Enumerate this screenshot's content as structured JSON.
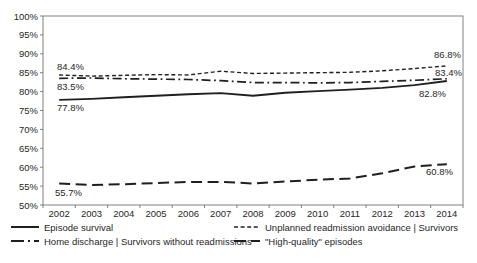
{
  "chart_data": {
    "type": "line",
    "title": "",
    "xlabel": "",
    "ylabel": "",
    "grid": false,
    "legend_position": "bottom two-column",
    "line_color": "#1f1f1f",
    "x": [
      "2002",
      "2003",
      "2004",
      "2005",
      "2006",
      "2007",
      "2008",
      "2009",
      "2010",
      "2011",
      "2012",
      "2013",
      "2014"
    ],
    "ylim": [
      50,
      100
    ],
    "yticks": [
      {
        "value": 100,
        "label": "100%"
      },
      {
        "value": 95,
        "label": "95%"
      },
      {
        "value": 90,
        "label": "90%"
      },
      {
        "value": 85,
        "label": "85%"
      },
      {
        "value": 80,
        "label": "80%"
      },
      {
        "value": 75,
        "label": "75%"
      },
      {
        "value": 70,
        "label": "70%"
      },
      {
        "value": 65,
        "label": "65%"
      },
      {
        "value": 60,
        "label": "60%"
      },
      {
        "value": 55,
        "label": "55%"
      },
      {
        "value": 50,
        "label": "50%"
      }
    ],
    "series": [
      {
        "name": "Episode survival",
        "dash": "solid",
        "values": [
          77.8,
          78.1,
          78.5,
          78.9,
          79.3,
          79.6,
          78.9,
          79.7,
          80.1,
          80.5,
          81.0,
          81.7,
          82.8
        ],
        "first_label": "77.8%",
        "last_label": "82.8%"
      },
      {
        "name": "Unplanned readmission avoidance | Survivors",
        "dash": "dash",
        "values": [
          84.4,
          84.1,
          84.3,
          84.5,
          84.4,
          85.4,
          84.8,
          84.9,
          85.0,
          85.1,
          85.5,
          86.1,
          86.8
        ],
        "first_label": "84.4%",
        "last_label": "86.8%"
      },
      {
        "name": "Home discharge | Survivors without readmissions",
        "dash": "dashdot",
        "values": [
          83.5,
          83.6,
          83.4,
          83.3,
          83.2,
          82.9,
          82.4,
          82.4,
          82.3,
          82.4,
          82.7,
          83.0,
          83.4
        ],
        "first_label": "83.5%",
        "last_label": "83.4%"
      },
      {
        "name": "\"High-quality\" episodes",
        "dash": "longdash",
        "values": [
          55.7,
          55.3,
          55.5,
          55.8,
          56.1,
          56.1,
          55.7,
          56.2,
          56.7,
          57.0,
          58.4,
          60.2,
          60.8
        ],
        "first_label": "55.7%",
        "last_label": "60.8%"
      }
    ],
    "annotations": [
      {
        "text": "84.4%",
        "x": 57,
        "y": 70,
        "anchor": "start"
      },
      {
        "text": "83.5%",
        "x": 57,
        "y": 90,
        "anchor": "start"
      },
      {
        "text": "77.8%",
        "x": 57,
        "y": 111,
        "anchor": "start"
      },
      {
        "text": "55.7%",
        "x": 55,
        "y": 196,
        "anchor": "start"
      },
      {
        "text": "86.8%",
        "x": 461,
        "y": 58,
        "anchor": "end"
      },
      {
        "text": "83.4%",
        "x": 462,
        "y": 76,
        "anchor": "end"
      },
      {
        "text": "82.8%",
        "x": 446,
        "y": 97,
        "anchor": "end"
      },
      {
        "text": "60.8%",
        "x": 453,
        "y": 175,
        "anchor": "end"
      }
    ]
  }
}
